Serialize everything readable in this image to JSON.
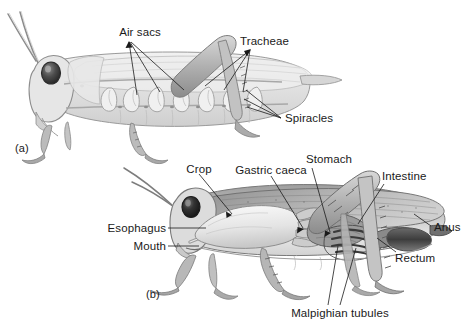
{
  "figure": {
    "background_color": "#ffffff",
    "ink_color": "#1a1a1a",
    "width": 470,
    "height": 331
  },
  "panels": [
    {
      "id": "a",
      "caption": "(a)",
      "subject": "Respiratory system of a grasshopper",
      "caption_x": 18,
      "caption_y": 148
    },
    {
      "id": "b",
      "caption": "(b)",
      "subject": "Digestive and excretory system of a grasshopper",
      "caption_x": 150,
      "caption_y": 293
    }
  ],
  "labels": {
    "air_sacs": "Air sacs",
    "tracheae": "Tracheae",
    "spiracles": "Spiracles",
    "crop": "Crop",
    "gastric_caeca": "Gastric caeca",
    "stomach": "Stomach",
    "intestine": "Intestine",
    "anus": "Anus",
    "rectum": "Rectum",
    "esophagus": "Esophagus",
    "mouth": "Mouth",
    "malpighian_tubules": "Malpighian tubules"
  }
}
